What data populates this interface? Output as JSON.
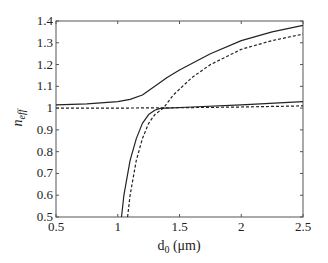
{
  "chart_data": {
    "type": "line",
    "title": "",
    "xlabel": "d0 (μm)",
    "ylabel": "n_eff",
    "xlim": [
      0.5,
      2.5
    ],
    "ylim": [
      0.5,
      1.4
    ],
    "grid": false,
    "legend": null,
    "x_ticks": [
      0.5,
      1,
      1.5,
      2,
      2.5
    ],
    "x_tick_labels": [
      "0.5",
      "1",
      "1.5",
      "2",
      "2.5"
    ],
    "y_ticks": [
      0.5,
      0.6,
      0.7,
      0.8,
      0.9,
      1,
      1.1,
      1.2,
      1.3,
      1.4
    ],
    "y_tick_labels": [
      "0.5",
      "0.6",
      "0.7",
      "0.8",
      "0.9",
      "1",
      "1.1",
      "1.2",
      "1.3",
      "1.4"
    ],
    "series": [
      {
        "name": "upper-solid",
        "style": "solid",
        "x": [
          0.5,
          0.75,
          1.0,
          1.1,
          1.2,
          1.3,
          1.4,
          1.5,
          1.75,
          2.0,
          2.25,
          2.5
        ],
        "y": [
          1.015,
          1.02,
          1.03,
          1.04,
          1.06,
          1.1,
          1.14,
          1.175,
          1.25,
          1.31,
          1.35,
          1.38
        ]
      },
      {
        "name": "upper-dashed",
        "style": "dashed",
        "x": [
          1.08,
          1.1,
          1.15,
          1.2,
          1.25,
          1.3,
          1.37,
          1.45,
          1.6,
          1.75,
          2.0,
          2.25,
          2.5
        ],
        "y": [
          0.5,
          0.6,
          0.76,
          0.86,
          0.93,
          0.97,
          1.0,
          1.06,
          1.14,
          1.2,
          1.27,
          1.31,
          1.34
        ]
      },
      {
        "name": "lower-solid",
        "style": "solid",
        "x": [
          1.03,
          1.05,
          1.1,
          1.15,
          1.2,
          1.25,
          1.3,
          1.35,
          1.4,
          1.6,
          2.0,
          2.5
        ],
        "y": [
          0.5,
          0.6,
          0.76,
          0.86,
          0.93,
          0.97,
          0.99,
          1.0,
          1.0,
          1.005,
          1.015,
          1.03
        ]
      },
      {
        "name": "lower-dashed",
        "style": "dashed",
        "x": [
          0.5,
          1.0,
          1.5,
          2.0,
          2.5
        ],
        "y": [
          1.0,
          1.0,
          1.002,
          1.005,
          1.01
        ]
      }
    ]
  }
}
